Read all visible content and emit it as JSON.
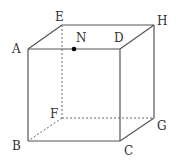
{
  "figure": {
    "type": "cube",
    "vertices": {
      "A": {
        "x": 28,
        "y": 49
      },
      "D": {
        "x": 120,
        "y": 49
      },
      "B": {
        "x": 28,
        "y": 141
      },
      "C": {
        "x": 120,
        "y": 141
      },
      "E": {
        "x": 62,
        "y": 25
      },
      "H": {
        "x": 154,
        "y": 25
      },
      "F": {
        "x": 62,
        "y": 118
      },
      "G": {
        "x": 154,
        "y": 118
      }
    },
    "point": {
      "name": "N",
      "x": 74,
      "y": 49,
      "on_edge": "AD"
    },
    "labels": {
      "A": "A",
      "B": "B",
      "C": "C",
      "D": "D",
      "E": "E",
      "F": "F",
      "G": "G",
      "H": "H",
      "N": "N"
    },
    "hidden_edges": [
      "EF",
      "FG",
      "FB"
    ],
    "colors": {
      "edge": "#555555",
      "point": "#000000",
      "label": "#333333"
    }
  }
}
